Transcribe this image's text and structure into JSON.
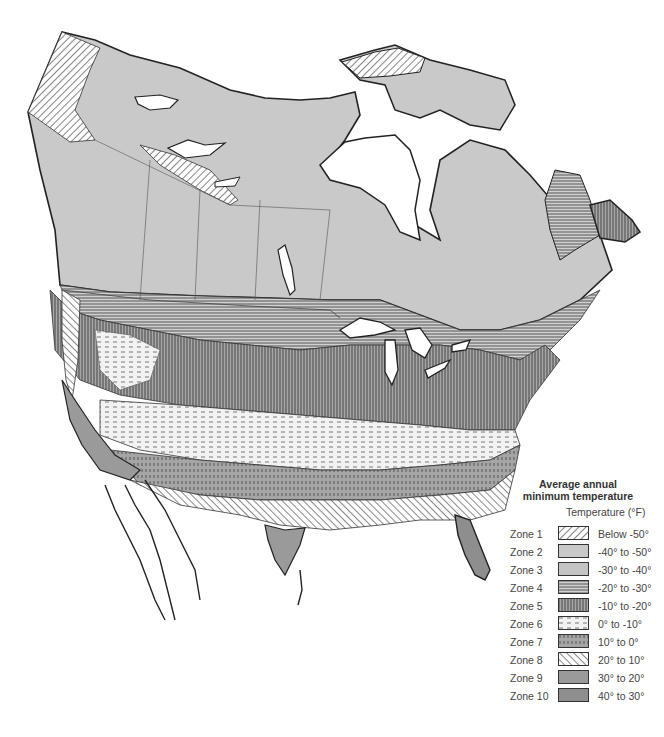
{
  "map": {
    "title": "Average annual minimum temperature",
    "title_line1": "Average annual",
    "title_line2": "minimum temperature",
    "region": "North America (Canada, United States, Mexico)",
    "colors": {
      "land_base": "#c9c9c9",
      "zone9": "#9a9a9a",
      "zone10": "#8e8e8e",
      "water": "#ffffff",
      "outline": "#222222",
      "boundary": "#555555",
      "hatch": "#444444"
    }
  },
  "legend": {
    "title_line1": "Average annual",
    "title_line2": "minimum temperature",
    "unit_label": "Temperature (°F)",
    "zones": [
      {
        "zone": "Zone 1",
        "range": "Below -50°",
        "pattern": "p1"
      },
      {
        "zone": "Zone 2",
        "range": "-40° to -50°",
        "pattern": "p2"
      },
      {
        "zone": "Zone 3",
        "range": "-30° to -40°",
        "pattern": "p3"
      },
      {
        "zone": "Zone 4",
        "range": "-20° to -30°",
        "pattern": "p4"
      },
      {
        "zone": "Zone 5",
        "range": "-10° to -20°",
        "pattern": "p5"
      },
      {
        "zone": "Zone 6",
        "range": "0° to -10°",
        "pattern": "p6"
      },
      {
        "zone": "Zone 7",
        "range": "10° to 0°",
        "pattern": "p7"
      },
      {
        "zone": "Zone 8",
        "range": "20° to 10°",
        "pattern": "p8"
      },
      {
        "zone": "Zone 9",
        "range": "30° to 20°",
        "pattern": "p9"
      },
      {
        "zone": "Zone 10",
        "range": "40° to 30°",
        "pattern": "p10"
      }
    ]
  }
}
